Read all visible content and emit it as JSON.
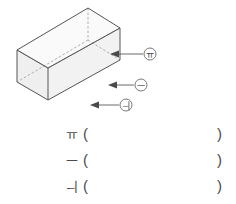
{
  "figure": {
    "name": "open-top-rectangular-box",
    "face_fill": "#f3f3f3",
    "face_fill_shaded": "#ececec",
    "edge_color": "#555555",
    "hidden_edge_color": "#9a9a9a",
    "callout_line_color": "#5a5a5a",
    "callouts": [
      {
        "id": "callout-a",
        "label": "ㅠ",
        "marker": "ㄲ",
        "target": "right-face"
      },
      {
        "id": "callout-b",
        "label": "ㅡ",
        "marker": "ㄴ",
        "target": "front-face"
      },
      {
        "id": "callout-c",
        "label": "ㅢ",
        "marker": "ㄷ",
        "target": "bottom-front-vertex"
      }
    ]
  },
  "callout_labels": {
    "a": "ㅠ",
    "b": "ㅡ",
    "c": "ㅢ"
  },
  "answers": {
    "paren_open": "(",
    "paren_close": ")",
    "rows": [
      {
        "marker": "ㅠ",
        "value": ""
      },
      {
        "marker": "ㅡ",
        "value": ""
      },
      {
        "marker": "ㅢ",
        "value": ""
      }
    ]
  }
}
